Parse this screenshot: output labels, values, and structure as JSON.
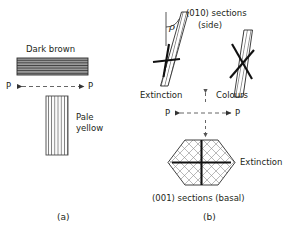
{
  "figure": {
    "width": 290,
    "height": 236,
    "background": "#ffffff",
    "ink": "#231f20",
    "hatch_color": "#6f6f6f",
    "dash_color": "#555555"
  },
  "panel_a": {
    "caption": "(a)",
    "prism_horizontal": {
      "label": "Dark brown",
      "fill": "#9a9a9a",
      "stripe_color": "#3f3f3f",
      "stripe_count": 7,
      "orientation": "horizontal"
    },
    "prism_vertical": {
      "label_line1": "Pale",
      "label_line2": "yellow",
      "fill": "#f2f2f2",
      "stripe_color": "#6f6f6f",
      "stripe_count": 7,
      "orientation": "vertical"
    },
    "polarizer_axis": {
      "left_label": "P",
      "right_label": "P",
      "style": "dashed double arrow"
    }
  },
  "panel_b": {
    "caption": "(b)",
    "heading_line1": "(010) sections",
    "heading_line2": "(side)",
    "angle_symbol": "ρ",
    "left_section": {
      "name": "extinction-section",
      "label": "Extinction",
      "cross_type": "upright cross"
    },
    "right_section": {
      "name": "colours-section",
      "label": "Colours",
      "cross_type": "oblique cross"
    },
    "polarizer_axis": {
      "left_label": "P",
      "right_label": "P",
      "style": "dashed double arrow"
    },
    "basal_section": {
      "label": "Extinction",
      "caption": "(001) sections (basal)",
      "shape": "hexagon",
      "cross_type": "upright cross"
    }
  }
}
